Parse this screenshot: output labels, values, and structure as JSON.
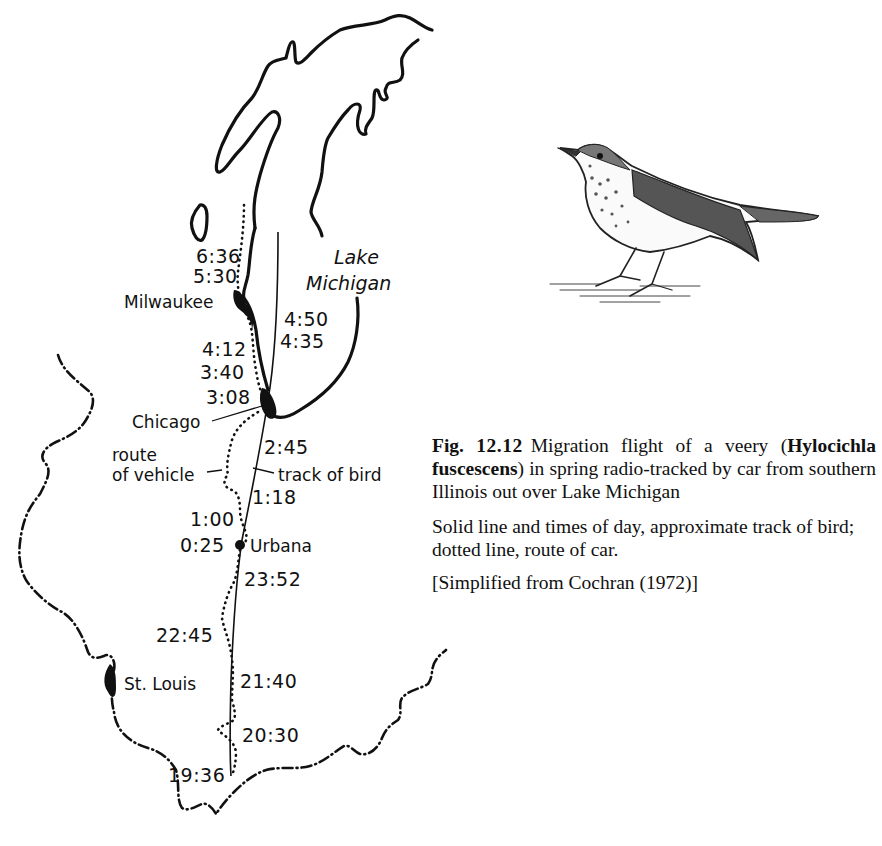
{
  "figure": {
    "number_label": "Fig.",
    "number": "12.12",
    "caption_lead": "Migration flight of a veery (",
    "species": "Hylocichla fuscescens",
    "caption_rest": ") in spring radio-tracked by car from southern Illinois out over Lake Michigan",
    "legend_text": "Solid line and times of day, approximate track of bird; dotted line, route of car.",
    "source": "[Simplified from Cochran (1972)]"
  },
  "map": {
    "lake_label_line1": "Lake",
    "lake_label_line2": "Michigan",
    "cities": {
      "milwaukee": "Milwaukee",
      "chicago": "Chicago",
      "urbana": "Urbana",
      "st_louis": "St. Louis"
    },
    "annotations": {
      "route_line1": "route",
      "route_line2": "of vehicle",
      "track": "track of bird"
    },
    "times": {
      "t0636": "6:36",
      "t0530": "5:30",
      "t0450": "4:50",
      "t0435": "4:35",
      "t0412": "4:12",
      "t0340": "3:40",
      "t0308": "3:08",
      "t0245": "2:45",
      "t0118": "1:18",
      "t0100": "1:00",
      "t0025": "0:25",
      "t2352": "23:52",
      "t2245": "22:45",
      "t2140": "21:40",
      "t2030": "20:30",
      "t1936": "19:36"
    }
  },
  "illustration": {
    "subject": "veery bird drawing"
  }
}
